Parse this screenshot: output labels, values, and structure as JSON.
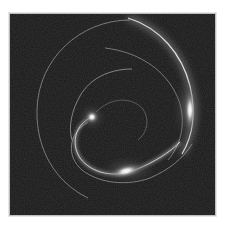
{
  "image": {
    "description": "Dark square panel showing luminous curved arcs and a spiral with three bright glowing spots, resembling a light-trail / gravitational-lens style render",
    "colors": {
      "background": "#171717",
      "border": "#bdbdbd",
      "arc": "#e8e8e8",
      "glow": "#ffffff"
    },
    "glows": [
      {
        "name": "left-glow",
        "cx": 82,
        "cy": 103
      },
      {
        "name": "right-glow",
        "cx": 179,
        "cy": 93
      },
      {
        "name": "bottom-glow",
        "cx": 116,
        "cy": 157
      }
    ]
  }
}
